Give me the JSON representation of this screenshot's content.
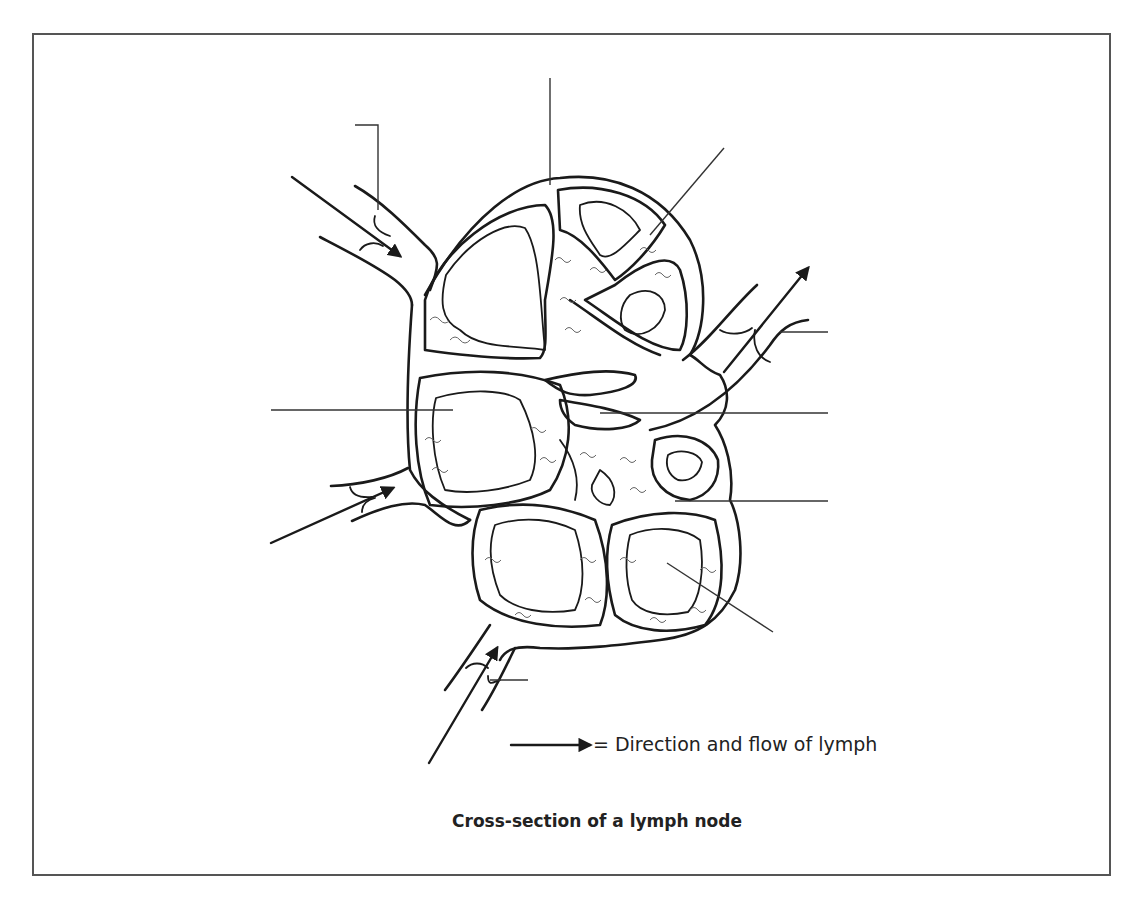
{
  "figure": {
    "caption": "Cross-section of a lymph node",
    "legend": {
      "symbol": "arrow",
      "text": "= Direction and flow of lymph"
    },
    "subject": "lymph node",
    "label_lines": [
      {
        "id": "label-afferent-valve",
        "from": [
          355,
          125
        ],
        "to": [
          378,
          210
        ],
        "label": ""
      },
      {
        "id": "label-capsule",
        "from": [
          550,
          78
        ],
        "to": [
          550,
          185
        ],
        "label": ""
      },
      {
        "id": "label-trabecula",
        "from": [
          724,
          148
        ],
        "to": [
          650,
          235
        ],
        "label": ""
      },
      {
        "id": "label-efferent-valve",
        "from": [
          780,
          332
        ],
        "to": [
          828,
          332
        ],
        "label": ""
      },
      {
        "id": "label-cortex-nodule",
        "from": [
          271,
          410
        ],
        "to": [
          453,
          410
        ],
        "label": ""
      },
      {
        "id": "label-medullary-sinus",
        "from": [
          600,
          413
        ],
        "to": [
          828,
          413
        ],
        "label": ""
      },
      {
        "id": "label-medullary-cord",
        "from": [
          675,
          501
        ],
        "to": [
          828,
          501
        ],
        "label": ""
      },
      {
        "id": "label-germinal-center",
        "from": [
          667,
          563
        ],
        "to": [
          773,
          632
        ],
        "label": ""
      },
      {
        "id": "label-afferent-valve-bottom",
        "from": [
          490,
          680
        ],
        "to": [
          528,
          680
        ],
        "label": ""
      }
    ],
    "flow_arrows": [
      {
        "id": "afferent-top",
        "direction": "into node"
      },
      {
        "id": "afferent-left",
        "direction": "into node"
      },
      {
        "id": "afferent-bottom",
        "direction": "into node"
      },
      {
        "id": "efferent-right",
        "direction": "out of node"
      }
    ]
  },
  "colors": {
    "line": "#1a1a1a",
    "frame": "#555555",
    "background": "#ffffff"
  }
}
